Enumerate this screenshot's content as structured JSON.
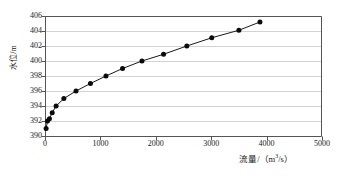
{
  "chart_data": {
    "type": "line",
    "title": "",
    "xlabel": "流量/（m³/s）",
    "xlabel_main": "流量/（m",
    "xlabel_sup": "3",
    "xlabel_tail": "/s）",
    "ylabel": "水位/m",
    "xlim": [
      0,
      5000
    ],
    "ylim": [
      390,
      406
    ],
    "xticks": [
      0,
      1000,
      2000,
      3000,
      4000,
      5000
    ],
    "yticks": [
      390,
      392,
      394,
      396,
      398,
      400,
      402,
      404,
      406
    ],
    "grid": "horizontal",
    "legend": "none",
    "marker": "filled-circle",
    "series_name": "水位流量关系曲线",
    "x": [
      20,
      45,
      80,
      130,
      200,
      340,
      560,
      820,
      1100,
      1400,
      1750,
      2140,
      2560,
      3010,
      3500,
      3880
    ],
    "y": [
      391.0,
      392.0,
      392.3,
      393.1,
      394.0,
      395.0,
      396.0,
      397.0,
      398.0,
      399.0,
      400.0,
      400.9,
      402.0,
      403.1,
      404.1,
      405.2
    ],
    "colors": {
      "line": "#1a1a1a",
      "marker": "#0a0a0a",
      "grid": "#c8c8c8",
      "frame": "#555555",
      "text": "#1a1a1a",
      "background": "#ffffff"
    }
  }
}
